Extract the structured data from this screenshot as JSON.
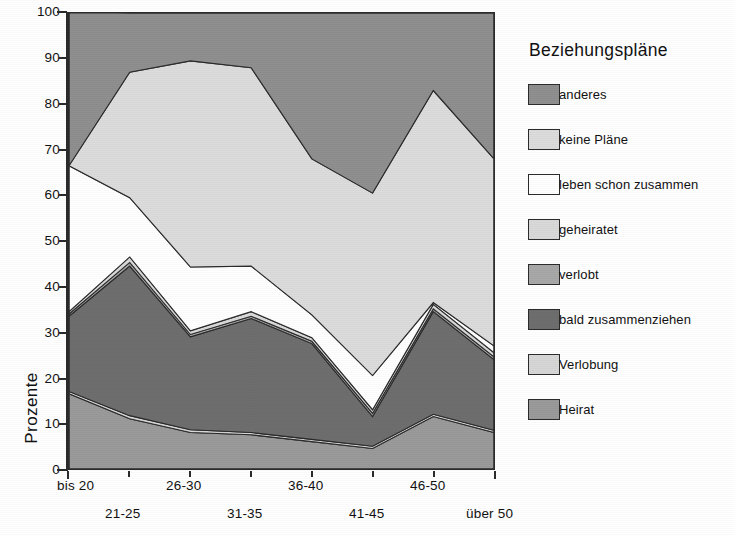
{
  "chart_data": {
    "type": "area",
    "title": "",
    "stacked": true,
    "xlabel": "",
    "ylabel": "Prozente",
    "ylim": [
      0,
      100
    ],
    "ytick_labels": [
      "0",
      "10",
      "20",
      "30",
      "40",
      "50",
      "60",
      "70",
      "80",
      "90",
      "100"
    ],
    "yticks": [
      0,
      10,
      20,
      30,
      40,
      50,
      60,
      70,
      80,
      90,
      100
    ],
    "grid": false,
    "legend_title": "Beziehungspläne",
    "legend_position": "right",
    "categories": [
      "bis 20",
      "21-25",
      "26-30",
      "31-35",
      "36-40",
      "41-45",
      "46-50",
      "über 50"
    ],
    "series": [
      {
        "name": "Heirat",
        "color": "#9a9a9a",
        "values": [
          16.5,
          11.0,
          8.0,
          7.5,
          6.0,
          4.5,
          11.5,
          8.0
        ]
      },
      {
        "name": "Verlobung",
        "color": "#d6d6d6",
        "values": [
          0.5,
          0.7,
          0.6,
          0.5,
          0.5,
          0.5,
          0.5,
          0.5
        ]
      },
      {
        "name": "bald zusammenziehen",
        "color": "#6e6e6e",
        "values": [
          16.5,
          32.8,
          20.4,
          25.0,
          21.0,
          6.5,
          22.5,
          15.5
        ]
      },
      {
        "name": "verlobt",
        "color": "#a8a8a8",
        "values": [
          0.5,
          0.8,
          0.5,
          0.5,
          0.5,
          0.7,
          0.6,
          0.6
        ]
      },
      {
        "name": "geheiratet",
        "color": "#d9d9d9",
        "values": [
          0.5,
          1.2,
          0.8,
          1.0,
          0.8,
          0.8,
          1.0,
          0.9
        ]
      },
      {
        "name": "leben schon zusammen",
        "color": "#ffffff",
        "values": [
          32.0,
          13.0,
          14.0,
          10.0,
          5.0,
          7.5,
          0.4,
          1.5
        ]
      },
      {
        "name": "keine Pläne",
        "color": "#dcdcdc",
        "values": [
          0.0,
          27.5,
          45.2,
          43.5,
          34.2,
          40.0,
          46.5,
          41.0
        ]
      },
      {
        "name": "anderes",
        "color": "#8f8f8f",
        "values": [
          34.0,
          13.0,
          10.5,
          12.0,
          32.0,
          39.5,
          17.0,
          32.0
        ]
      }
    ],
    "cumulative_top_boundary": [
      66.0,
      87.0,
      89.5,
      88.0,
      68.0,
      60.0,
      83.0,
      68.0
    ]
  },
  "legend": {
    "title": "Beziehungspläne",
    "items": [
      {
        "label": "anderes",
        "color": "#8f8f8f"
      },
      {
        "label": "keine Pläne",
        "color": "#dcdcdc"
      },
      {
        "label": "leben schon zusammen",
        "color": "#ffffff"
      },
      {
        "label": "geheiratet",
        "color": "#d9d9d9"
      },
      {
        "label": "verlobt",
        "color": "#a8a8a8"
      },
      {
        "label": "bald zusammenziehen",
        "color": "#6e6e6e"
      },
      {
        "label": "Verlobung",
        "color": "#d6d6d6"
      },
      {
        "label": "Heirat",
        "color": "#9a9a9a"
      }
    ]
  },
  "axis": {
    "y_title": "Prozente",
    "y_ticks": [
      "100",
      "90",
      "80",
      "70",
      "60",
      "50",
      "40",
      "30",
      "20",
      "10",
      "0"
    ],
    "x_ticks_top": [
      "bis 20",
      "26-30",
      "36-40",
      "46-50"
    ],
    "x_ticks_bottom": [
      "21-25",
      "31-35",
      "41-45",
      "über 50"
    ]
  }
}
